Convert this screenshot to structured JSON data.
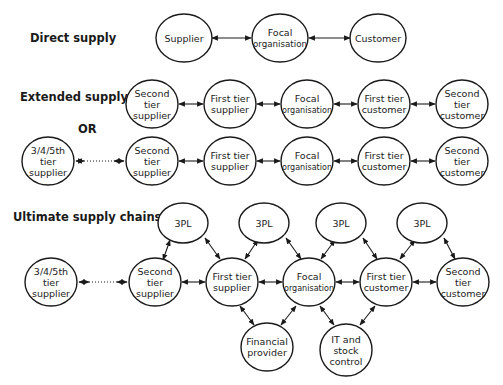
{
  "sections": {
    "direct": {
      "label": "Direct supply"
    },
    "extended": {
      "label": "Extended supply",
      "or_label": "OR"
    },
    "ultimate": {
      "label": "Ultimate supply chains"
    }
  },
  "nodes": {
    "d_supplier": [
      "Supplier"
    ],
    "d_focal": [
      "Focal",
      "organisation"
    ],
    "d_customer": [
      "Customer"
    ],
    "e1_second_supplier": [
      "Second",
      "tier",
      "supplier"
    ],
    "e1_first_supplier": [
      "First tier",
      "supplier"
    ],
    "e1_focal": [
      "Focal",
      "organisation"
    ],
    "e1_first_customer": [
      "First tier",
      "customer"
    ],
    "e1_second_customer": [
      "Second",
      "tier",
      "customer"
    ],
    "e2_n_tier_supplier": [
      "3/4/5th",
      "tier",
      "supplier"
    ],
    "e2_second_supplier": [
      "Second",
      "tier",
      "supplier"
    ],
    "e2_first_supplier": [
      "First tier",
      "supplier"
    ],
    "e2_focal": [
      "Focal",
      "organisation"
    ],
    "e2_first_customer": [
      "First tier",
      "customer"
    ],
    "e2_second_customer": [
      "Second",
      "tier",
      "customer"
    ],
    "u_3pl_1": [
      "3PL"
    ],
    "u_3pl_2": [
      "3PL"
    ],
    "u_3pl_3": [
      "3PL"
    ],
    "u_3pl_4": [
      "3PL"
    ],
    "u_n_tier_supplier": [
      "3/4/5th",
      "tier",
      "supplier"
    ],
    "u_second_supplier": [
      "Second",
      "tier",
      "supplier"
    ],
    "u_first_supplier": [
      "First tier",
      "supplier"
    ],
    "u_focal": [
      "Focal",
      "organisation"
    ],
    "u_first_customer": [
      "First tier",
      "customer"
    ],
    "u_second_customer": [
      "Second",
      "tier",
      "customer"
    ],
    "u_financial": [
      "Financial",
      "provider"
    ],
    "u_it": [
      "IT and",
      "stock",
      "control"
    ]
  },
  "colors": {
    "stroke": "#1a1a1a",
    "text": "#222222",
    "background": "#ffffff"
  }
}
